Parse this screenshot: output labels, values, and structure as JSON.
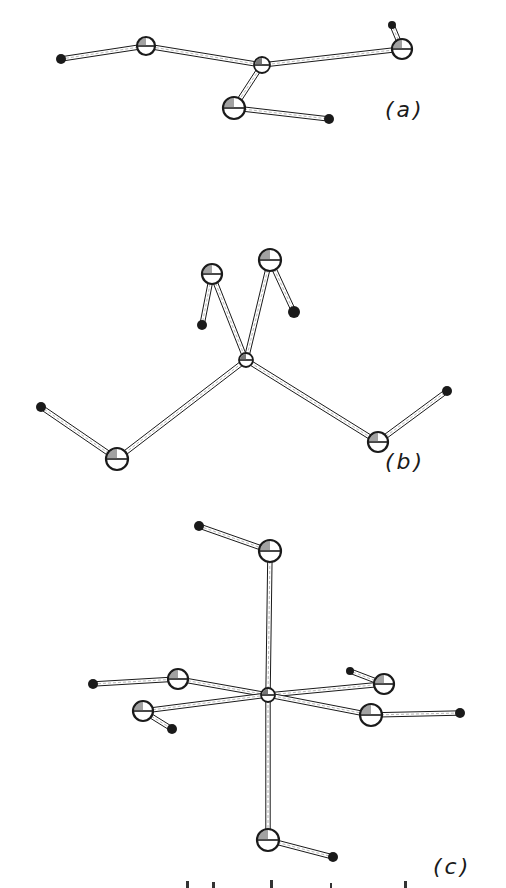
{
  "figure": {
    "colors": {
      "ink": "#1a1a1a",
      "bond_fill": "#ffffff",
      "background": "#ffffff"
    },
    "panels": [
      {
        "id": "a",
        "label": "(a)",
        "label_pos": [
          385,
          113
        ],
        "top": 0,
        "height": 160,
        "atoms": [
          {
            "x": 61,
            "y": 59,
            "r": 5,
            "kind": "small"
          },
          {
            "x": 146,
            "y": 46,
            "r": 9,
            "kind": "large"
          },
          {
            "x": 262,
            "y": 65,
            "r": 8,
            "kind": "center"
          },
          {
            "x": 402,
            "y": 49,
            "r": 10,
            "kind": "large"
          },
          {
            "x": 392,
            "y": 25,
            "r": 4,
            "kind": "small"
          },
          {
            "x": 234,
            "y": 108,
            "r": 11,
            "kind": "large"
          },
          {
            "x": 329,
            "y": 119,
            "r": 5,
            "kind": "small"
          }
        ],
        "bonds": [
          [
            0,
            1
          ],
          [
            1,
            2
          ],
          [
            2,
            3
          ],
          [
            3,
            4
          ],
          [
            2,
            5
          ],
          [
            5,
            6
          ]
        ]
      },
      {
        "id": "b",
        "label": "(b)",
        "label_pos": [
          385,
          465
        ],
        "top": 230,
        "height": 250,
        "atoms": [
          {
            "x": 212,
            "y": 44,
            "r": 10,
            "kind": "large"
          },
          {
            "x": 270,
            "y": 30,
            "r": 11,
            "kind": "large"
          },
          {
            "x": 202,
            "y": 95,
            "r": 5,
            "kind": "small"
          },
          {
            "x": 294,
            "y": 82,
            "r": 6,
            "kind": "small"
          },
          {
            "x": 246,
            "y": 130,
            "r": 7,
            "kind": "center"
          },
          {
            "x": 117,
            "y": 229,
            "r": 11,
            "kind": "large"
          },
          {
            "x": 41,
            "y": 177,
            "r": 5,
            "kind": "small"
          },
          {
            "x": 378,
            "y": 212,
            "r": 10,
            "kind": "large"
          },
          {
            "x": 447,
            "y": 161,
            "r": 5,
            "kind": "small"
          }
        ],
        "bonds": [
          [
            0,
            2
          ],
          [
            0,
            4
          ],
          [
            1,
            4
          ],
          [
            1,
            3
          ],
          [
            4,
            5
          ],
          [
            5,
            6
          ],
          [
            4,
            7
          ],
          [
            7,
            8
          ]
        ]
      },
      {
        "id": "c",
        "label": "(c)",
        "label_pos": [
          433,
          870
        ],
        "top": 500,
        "height": 378,
        "atoms": [
          {
            "x": 199,
            "y": 26,
            "r": 5,
            "kind": "small"
          },
          {
            "x": 270,
            "y": 51,
            "r": 11,
            "kind": "large"
          },
          {
            "x": 268,
            "y": 195,
            "r": 7,
            "kind": "center"
          },
          {
            "x": 268,
            "y": 340,
            "r": 11,
            "kind": "large"
          },
          {
            "x": 333,
            "y": 357,
            "r": 5,
            "kind": "small"
          },
          {
            "x": 93,
            "y": 184,
            "r": 5,
            "kind": "small"
          },
          {
            "x": 178,
            "y": 179,
            "r": 10,
            "kind": "large"
          },
          {
            "x": 143,
            "y": 211,
            "r": 10,
            "kind": "large"
          },
          {
            "x": 172,
            "y": 229,
            "r": 5,
            "kind": "small"
          },
          {
            "x": 384,
            "y": 184,
            "r": 10,
            "kind": "large"
          },
          {
            "x": 350,
            "y": 171,
            "r": 4,
            "kind": "small"
          },
          {
            "x": 371,
            "y": 215,
            "r": 11,
            "kind": "large"
          },
          {
            "x": 460,
            "y": 213,
            "r": 5,
            "kind": "small"
          }
        ],
        "bonds": [
          [
            0,
            1
          ],
          [
            1,
            2
          ],
          [
            2,
            3
          ],
          [
            3,
            4
          ],
          [
            5,
            6
          ],
          [
            6,
            2
          ],
          [
            7,
            2
          ],
          [
            7,
            8
          ],
          [
            2,
            9
          ],
          [
            9,
            10
          ],
          [
            2,
            11
          ],
          [
            11,
            12
          ]
        ]
      }
    ],
    "caption_clipped": ""
  }
}
